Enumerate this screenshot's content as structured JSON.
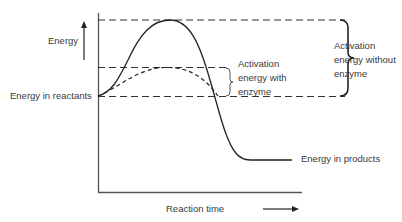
{
  "diagram": {
    "labels": {
      "energy": "Energy",
      "energy_in_reactants": "Energy in reactants",
      "energy_in_products": "Energy in products",
      "reaction_time": "Reaction time",
      "activation_with_enzyme": [
        "Activation",
        "energy with",
        "enzyme"
      ],
      "activation_without_enzyme": [
        "Activation",
        "energy without",
        "enzyme"
      ]
    },
    "curves": [
      {
        "name": "without enzyme",
        "style": "solid"
      },
      {
        "name": "with enzyme",
        "style": "dashed"
      }
    ],
    "colors": {
      "line": "#222222",
      "axis": "#555555",
      "text": "#3a3a3a"
    }
  }
}
